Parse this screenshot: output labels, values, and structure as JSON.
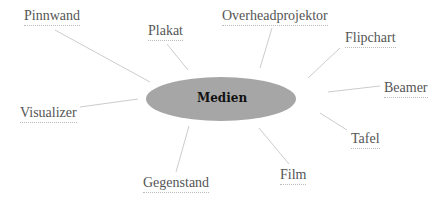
{
  "diagram": {
    "center": {
      "label": "Medien",
      "cx": 221,
      "cy": 99,
      "rx": 75,
      "ry": 22,
      "fill": "#a6a6a6"
    },
    "line_color": "#cccccc",
    "nodes": [
      {
        "label": "Pinnwand",
        "x": 24,
        "y": 8,
        "line": [
          55,
          30,
          150,
          82
        ]
      },
      {
        "label": "Plakat",
        "x": 148,
        "y": 23,
        "line": [
          167,
          44,
          188,
          70
        ]
      },
      {
        "label": "Overheadprojektor",
        "x": 222,
        "y": 8,
        "line": [
          272,
          28,
          260,
          68
        ]
      },
      {
        "label": "Flipchart",
        "x": 345,
        "y": 30,
        "line": [
          340,
          48,
          308,
          78
        ]
      },
      {
        "label": "Beamer",
        "x": 384,
        "y": 80,
        "line": [
          380,
          86,
          328,
          92
        ]
      },
      {
        "label": "Tafel",
        "x": 351,
        "y": 131,
        "line": [
          347,
          130,
          320,
          113
        ]
      },
      {
        "label": "Film",
        "x": 280,
        "y": 167,
        "line": [
          289,
          164,
          259,
          128
        ]
      },
      {
        "label": "Gegenstand",
        "x": 143,
        "y": 175,
        "line": [
          176,
          172,
          189,
          126
        ]
      },
      {
        "label": "Visualizer",
        "x": 20,
        "y": 105,
        "line": [
          80,
          107,
          138,
          99
        ]
      }
    ]
  }
}
